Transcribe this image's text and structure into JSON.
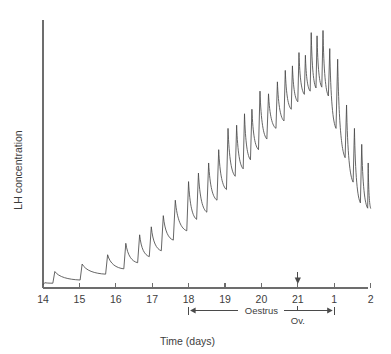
{
  "chart_data": {
    "type": "line",
    "title": "",
    "xlabel": "Time (days)",
    "ylabel": "LH concentration",
    "grid": false,
    "legend": null,
    "x_tick_labels": [
      "14",
      "15",
      "16",
      "17",
      "18",
      "19",
      "20",
      "21",
      "1",
      "2"
    ],
    "x_tick_days": [
      14,
      15,
      16,
      17,
      18,
      19,
      20,
      21,
      22,
      23
    ],
    "xlim": [
      14,
      23
    ],
    "ylim": [
      0,
      1
    ],
    "y_axis_ticks": false,
    "y_axis_tick_labels": [],
    "annotations": [
      {
        "name": "oestrus-bracket",
        "label": "Oestrus",
        "start_day": 18,
        "end_day": 22,
        "style": "double-arrow-bracket"
      },
      {
        "name": "ovulation-marker",
        "label": "Ov.",
        "day": 21,
        "style": "down-arrow"
      }
    ],
    "series": [
      {
        "name": "LH concentration",
        "color": "#4a4a4a",
        "pulses": [
          {
            "day": 14.0,
            "peak": 0.02,
            "trough": 0.012
          },
          {
            "day": 14.27,
            "peak": 0.062,
            "trough": 0.018
          },
          {
            "day": 15.02,
            "peak": 0.09,
            "trough": 0.03
          },
          {
            "day": 15.72,
            "peak": 0.125,
            "trough": 0.052
          },
          {
            "day": 16.22,
            "peak": 0.168,
            "trough": 0.072
          },
          {
            "day": 16.6,
            "peak": 0.2,
            "trough": 0.095
          },
          {
            "day": 16.92,
            "peak": 0.23,
            "trough": 0.118
          },
          {
            "day": 17.25,
            "peak": 0.272,
            "trough": 0.14
          },
          {
            "day": 17.58,
            "peak": 0.33,
            "trough": 0.18
          },
          {
            "day": 17.95,
            "peak": 0.4,
            "trough": 0.215
          },
          {
            "day": 18.22,
            "peak": 0.432,
            "trough": 0.258
          },
          {
            "day": 18.5,
            "peak": 0.47,
            "trough": 0.285
          },
          {
            "day": 18.78,
            "peak": 0.52,
            "trough": 0.33
          },
          {
            "day": 19.04,
            "peak": 0.6,
            "trough": 0.37
          },
          {
            "day": 19.28,
            "peak": 0.612,
            "trough": 0.42
          },
          {
            "day": 19.5,
            "peak": 0.655,
            "trough": 0.448
          },
          {
            "day": 19.7,
            "peak": 0.672,
            "trough": 0.482
          },
          {
            "day": 19.92,
            "peak": 0.74,
            "trough": 0.52
          },
          {
            "day": 20.15,
            "peak": 0.73,
            "trough": 0.56
          },
          {
            "day": 20.4,
            "peak": 0.775,
            "trough": 0.6
          },
          {
            "day": 20.62,
            "peak": 0.818,
            "trough": 0.628
          },
          {
            "day": 20.82,
            "peak": 0.835,
            "trough": 0.672
          },
          {
            "day": 21.0,
            "peak": 0.885,
            "trough": 0.7
          },
          {
            "day": 21.18,
            "peak": 0.875,
            "trough": 0.728
          },
          {
            "day": 21.34,
            "peak": 0.96,
            "trough": 0.74
          },
          {
            "day": 21.5,
            "peak": 0.948,
            "trough": 0.752
          },
          {
            "day": 21.66,
            "peak": 0.968,
            "trough": 0.755
          },
          {
            "day": 21.84,
            "peak": 0.9,
            "trough": 0.722
          },
          {
            "day": 22.05,
            "peak": 0.86,
            "trough": 0.6
          },
          {
            "day": 22.3,
            "peak": 0.688,
            "trough": 0.49
          },
          {
            "day": 22.52,
            "peak": 0.6,
            "trough": 0.398
          },
          {
            "day": 22.72,
            "peak": 0.54,
            "trough": 0.32
          },
          {
            "day": 22.92,
            "peak": 0.47,
            "trough": 0.3
          }
        ],
        "end_day": 23.0,
        "end_value": 0.3
      }
    ]
  }
}
